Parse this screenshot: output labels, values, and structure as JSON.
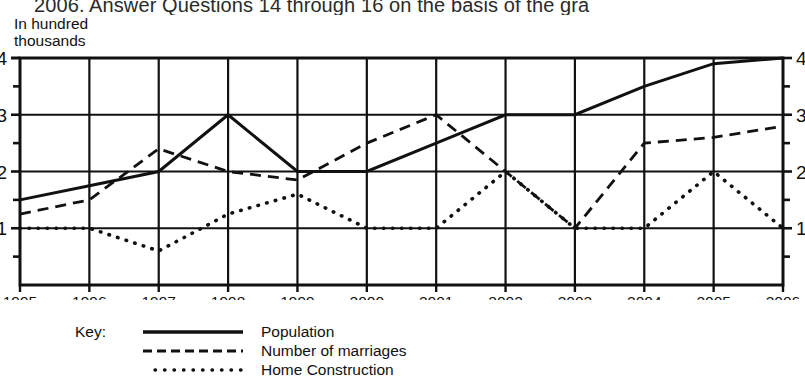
{
  "page": {
    "clipped_header_text": "2006. Answer Questions 14 through 16 on the basis of the gra"
  },
  "chart_caption": "In hundred\nthousands",
  "legend": {
    "title": "Key:",
    "entries": [
      {
        "label": "Population",
        "style": "solid",
        "swatch_name": "solid-line-swatch"
      },
      {
        "label": "Number of marriages",
        "style": "dashed",
        "swatch_name": "dashed-line-swatch"
      },
      {
        "label": "Home Construction",
        "style": "dotted",
        "swatch_name": "dotted-line-swatch"
      }
    ]
  },
  "chart_data": {
    "type": "line",
    "title": "",
    "subtitle": "",
    "xlabel": "",
    "ylabel": "In hundred thousands",
    "x": [
      1995,
      1996,
      1997,
      1998,
      1999,
      2000,
      2001,
      2002,
      2003,
      2004,
      2005,
      2006
    ],
    "categories": [
      "1995",
      "1996",
      "1997",
      "1998",
      "1999",
      "2000",
      "2001",
      "2002",
      "2003",
      "2004",
      "2005",
      "2006"
    ],
    "xlim": [
      1995,
      2006
    ],
    "ylim": [
      0,
      4
    ],
    "yticks": [
      1,
      2,
      3,
      4
    ],
    "ytick_labels_left": [
      "1",
      "2",
      "3",
      "4"
    ],
    "ytick_labels_right": [
      "1",
      "2",
      "3",
      "4"
    ],
    "minor_yticks": [
      0.5,
      1.5,
      2.5,
      3.5
    ],
    "grid": true,
    "grid_axes": "both",
    "legend_position": "below-left",
    "series": [
      {
        "name": "Population",
        "style": "solid",
        "values": [
          1.5,
          1.75,
          2.0,
          3.0,
          2.0,
          2.0,
          2.5,
          3.0,
          3.0,
          3.5,
          3.9,
          4.0
        ]
      },
      {
        "name": "Number of marriages",
        "style": "dashed",
        "values": [
          1.25,
          1.5,
          2.4,
          2.0,
          1.85,
          2.5,
          3.0,
          2.0,
          1.0,
          2.5,
          2.6,
          2.8
        ]
      },
      {
        "name": "Home Construction",
        "style": "dotted",
        "values": [
          1.0,
          1.0,
          0.6,
          1.25,
          1.6,
          1.0,
          1.0,
          2.0,
          1.0,
          1.0,
          2.0,
          1.0
        ]
      }
    ]
  }
}
